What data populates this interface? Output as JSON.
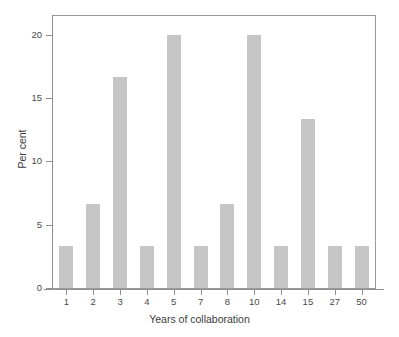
{
  "chart_data": {
    "type": "bar",
    "title": "",
    "subtitle": "",
    "xlabel": "Years of collaboration",
    "ylabel": "Per cent",
    "categories": [
      "1",
      "2",
      "3",
      "4",
      "5",
      "7",
      "8",
      "10",
      "14",
      "15",
      "27",
      "50"
    ],
    "values": [
      3.33,
      6.67,
      16.67,
      3.33,
      20,
      3.33,
      6.67,
      20,
      3.33,
      13.33,
      3.33,
      3.33
    ],
    "ylim": [
      0,
      21.5
    ],
    "yticks": [
      0,
      5,
      10,
      15,
      20
    ],
    "ytick_labels": [
      "0",
      "5",
      "10",
      "15",
      "20"
    ],
    "grid": false,
    "legend": false,
    "bar_color": "#c6c6c6",
    "frame_color": "#9a9a9a",
    "axis_color": "#8f8f8f",
    "background": "#ffffff"
  },
  "axes": {
    "x_title": "Years of collaboration",
    "y_title": "Per cent"
  }
}
